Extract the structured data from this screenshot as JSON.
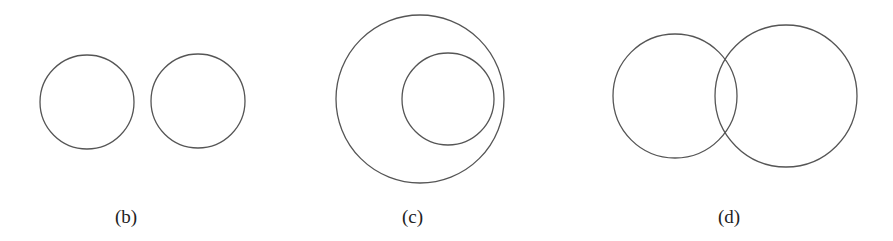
{
  "figure": {
    "stroke_color": "#555555",
    "background": "#ffffff",
    "panels": [
      {
        "id": "b",
        "label": "(b)",
        "relation": "disjoint",
        "label_pos": {
          "x": 115,
          "y": 207
        },
        "circles": [
          {
            "cx": 87,
            "cy": 102,
            "r": 47
          },
          {
            "cx": 198,
            "cy": 101,
            "r": 47
          }
        ]
      },
      {
        "id": "c",
        "label": "(c)",
        "relation": "contained",
        "label_pos": {
          "x": 402,
          "y": 207
        },
        "circles": [
          {
            "cx": 420,
            "cy": 99,
            "r": 84
          },
          {
            "cx": 448,
            "cy": 99,
            "r": 46
          }
        ]
      },
      {
        "id": "d",
        "label": "(d)",
        "relation": "intersecting",
        "label_pos": {
          "x": 718,
          "y": 207
        },
        "circles": [
          {
            "cx": 675,
            "cy": 96,
            "r": 62
          },
          {
            "cx": 786,
            "cy": 96,
            "r": 71
          }
        ]
      }
    ]
  }
}
